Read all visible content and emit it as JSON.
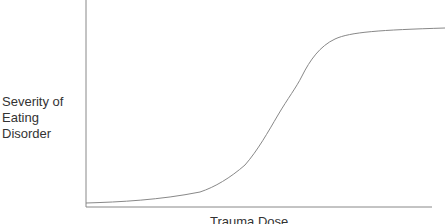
{
  "chart_data": {
    "type": "line",
    "title": "",
    "xlabel": "Trauma Dose",
    "ylabel": "Severity of Eating Disorder",
    "ylabel_lines": [
      "Severity of",
      "Eating",
      "Disorder"
    ],
    "grid": false,
    "legend": null,
    "ticks": {
      "x": [],
      "y": []
    },
    "series": [
      {
        "name": "severity",
        "description": "S-shaped (sigmoid) curve: flat near zero, steep rise in middle, plateau near max",
        "x": [
          0,
          0.18,
          0.33,
          0.4,
          0.48,
          0.53,
          0.59,
          0.63,
          0.68,
          0.73,
          0.85,
          1.0
        ],
        "y": [
          0.02,
          0.03,
          0.07,
          0.12,
          0.23,
          0.37,
          0.52,
          0.65,
          0.76,
          0.82,
          0.85,
          0.87
        ]
      }
    ],
    "xlim": [
      0,
      1
    ],
    "ylim": [
      0,
      1
    ]
  },
  "plot": {
    "axis_color": "#888888",
    "curve_color": "#888888",
    "curve_path": "M86,203 C120,202 160,200 200,192 C215,187 230,178 245,165 C258,150 268,132 278,115 C288,98 296,88 302,76 C310,60 320,46 335,39 C350,32 380,30 445,28"
  }
}
